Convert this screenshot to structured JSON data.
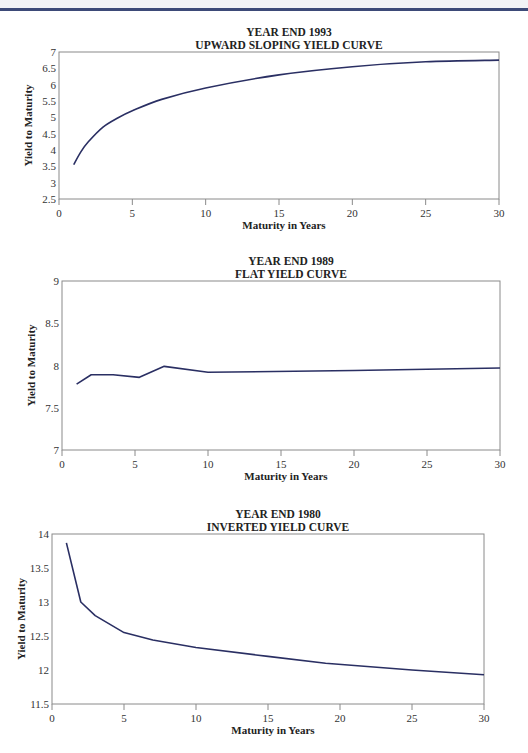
{
  "page": {
    "header_rule_color": "#3d4a78",
    "curve_color": "#2a2f63"
  },
  "chart_data": [
    {
      "type": "line",
      "title": "YEAR END 1993",
      "subtitle": "UPWARD SLOPING YIELD CURVE",
      "xlabel": "Maturity in Years",
      "ylabel": "Yield to Maturity",
      "xlim": [
        0,
        30
      ],
      "ylim": [
        2.5,
        7
      ],
      "x_ticks": [
        "0",
        "5",
        "10",
        "15",
        "20",
        "25",
        "30"
      ],
      "y_ticks": [
        "2.5",
        "3",
        "3.5",
        "4",
        "4.5",
        "5",
        "5.5",
        "6",
        "6.5",
        "7"
      ],
      "grid": false,
      "x": [
        1,
        1.5,
        2,
        3,
        4,
        5,
        7,
        10,
        15,
        20,
        25,
        30
      ],
      "values": [
        3.55,
        3.95,
        4.25,
        4.7,
        4.98,
        5.2,
        5.55,
        5.9,
        6.3,
        6.55,
        6.7,
        6.75
      ]
    },
    {
      "type": "line",
      "title": "YEAR END 1989",
      "subtitle": "FLAT YIELD CURVE",
      "xlabel": "Maturity in Years",
      "ylabel": "Yield to Maturity",
      "xlim": [
        0,
        30
      ],
      "ylim": [
        7,
        9
      ],
      "x_ticks": [
        "0",
        "5",
        "10",
        "15",
        "20",
        "25",
        "30"
      ],
      "y_ticks": [
        "7",
        "7.5",
        "8",
        "8.5",
        "9"
      ],
      "grid": false,
      "x": [
        1,
        2,
        3.5,
        5.3,
        7,
        10,
        20,
        30
      ],
      "values": [
        7.78,
        7.89,
        7.89,
        7.86,
        7.99,
        7.92,
        7.94,
        7.97
      ]
    },
    {
      "type": "line",
      "title": "YEAR END 1980",
      "subtitle": "INVERTED YIELD CURVE",
      "xlabel": "Maturity in Years",
      "ylabel": "Yield to Maturity",
      "xlim": [
        0,
        30
      ],
      "ylim": [
        11.5,
        14
      ],
      "x_ticks": [
        "0",
        "5",
        "10",
        "15",
        "20",
        "25",
        "30"
      ],
      "y_ticks": [
        "11.5",
        "12",
        "12.5",
        "13",
        "13.5",
        "14"
      ],
      "grid": false,
      "x": [
        1,
        2,
        3,
        5,
        7,
        10,
        15,
        19,
        25,
        30
      ],
      "values": [
        13.87,
        13.0,
        12.8,
        12.55,
        12.44,
        12.33,
        12.2,
        12.1,
        12.0,
        11.93
      ]
    }
  ]
}
